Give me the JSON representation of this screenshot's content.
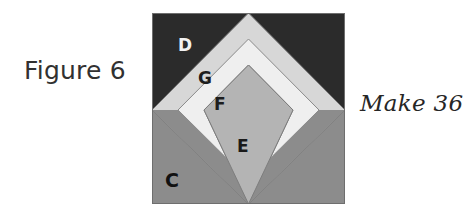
{
  "figure": {
    "caption_left": "Figure 6",
    "caption_right": "Make 36"
  },
  "block": {
    "background_color": "#ffffff",
    "patches": [
      {
        "id": "D",
        "label": "D",
        "color": "#2b2b2b",
        "role": "dark-corner-triangles-top"
      },
      {
        "id": "C",
        "label": "C",
        "color": "#8c8c8c",
        "role": "medium-gray-corner-triangles-bottom"
      },
      {
        "id": "G",
        "label": "G",
        "color": "#d7d7d7",
        "role": "outer-chevron-band"
      },
      {
        "id": "F",
        "label": "F",
        "color": "#efefef",
        "role": "inner-chevron-band"
      },
      {
        "id": "E",
        "label": "E",
        "color": "#b4b4b4",
        "role": "center-diamond"
      }
    ],
    "outline_color": "#6e6e6e",
    "geometry": {
      "width": 193,
      "height": 191,
      "diamond_top": [
        96.5,
        0
      ],
      "diamond_left": [
        0,
        97
      ],
      "diamond_right": [
        193,
        97
      ],
      "diamond_bottom": [
        96.5,
        191
      ],
      "band_outer_offset": 26,
      "band_inner_offset": 44
    }
  }
}
